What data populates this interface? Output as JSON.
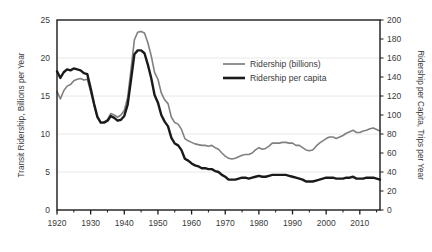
{
  "chart_data": {
    "type": "line",
    "title": "",
    "xlabel": "",
    "ylabel": "Transit Ridership, Billions per Year",
    "y2label": "Ridership per Capita, Trips per Year",
    "xlim": [
      1920,
      2016
    ],
    "ylim": [
      0,
      25
    ],
    "y2lim": [
      0,
      200
    ],
    "grid": true,
    "legend_position": "center-right-inside",
    "xticks": [
      1920,
      1930,
      1940,
      1950,
      1960,
      1970,
      1980,
      1990,
      2000,
      2010
    ],
    "xtick_labels": [
      "1920",
      "1930",
      "1940",
      "1950",
      "1960",
      "1970",
      "1980",
      "1990",
      "2000",
      "2010"
    ],
    "xminor_step": 5,
    "yticks": [
      0,
      5,
      10,
      15,
      20,
      25
    ],
    "ytick_labels": [
      "0",
      "5",
      "10",
      "15",
      "20",
      "25"
    ],
    "y2ticks": [
      0,
      20,
      40,
      60,
      80,
      100,
      120,
      140,
      160,
      180,
      200
    ],
    "y2tick_labels": [
      "0",
      "20",
      "40",
      "60",
      "80",
      "100",
      "120",
      "140",
      "160",
      "180",
      "200"
    ],
    "series": [
      {
        "name": "Ridership (billions)",
        "color": "#808080",
        "axis": "left",
        "width": 1.6,
        "x": [
          1920,
          1921,
          1922,
          1923,
          1924,
          1925,
          1926,
          1927,
          1928,
          1929,
          1930,
          1931,
          1932,
          1933,
          1934,
          1935,
          1936,
          1937,
          1938,
          1939,
          1940,
          1941,
          1942,
          1943,
          1944,
          1945,
          1946,
          1947,
          1948,
          1949,
          1950,
          1951,
          1952,
          1953,
          1954,
          1955,
          1956,
          1957,
          1958,
          1959,
          1960,
          1961,
          1962,
          1963,
          1964,
          1965,
          1966,
          1967,
          1968,
          1969,
          1970,
          1971,
          1972,
          1973,
          1974,
          1975,
          1976,
          1977,
          1978,
          1979,
          1980,
          1981,
          1982,
          1983,
          1984,
          1985,
          1986,
          1987,
          1988,
          1989,
          1990,
          1991,
          1992,
          1993,
          1994,
          1995,
          1996,
          1997,
          1998,
          1999,
          2000,
          2001,
          2002,
          2003,
          2004,
          2005,
          2006,
          2007,
          2008,
          2009,
          2010,
          2011,
          2012,
          2013,
          2014,
          2015,
          2016
        ],
        "values": [
          15.6,
          14.6,
          15.7,
          16.3,
          16.5,
          17.0,
          17.2,
          17.3,
          17.1,
          17.2,
          15.6,
          13.8,
          12.2,
          11.5,
          11.6,
          11.9,
          12.7,
          12.5,
          12.2,
          12.5,
          13.1,
          14.8,
          18.5,
          22.4,
          23.4,
          23.5,
          23.3,
          22.0,
          20.3,
          18.1,
          17.2,
          15.4,
          14.5,
          14.0,
          12.2,
          11.5,
          11.3,
          10.6,
          9.4,
          9.1,
          8.9,
          8.7,
          8.6,
          8.5,
          8.5,
          8.4,
          8.5,
          8.2,
          8.0,
          7.5,
          7.1,
          6.8,
          6.7,
          6.8,
          7.0,
          7.2,
          7.3,
          7.3,
          7.5,
          7.9,
          8.2,
          8.0,
          8.1,
          8.4,
          8.8,
          8.8,
          8.8,
          8.9,
          8.9,
          8.8,
          8.8,
          8.5,
          8.5,
          8.2,
          7.9,
          7.8,
          7.9,
          8.4,
          8.8,
          9.1,
          9.4,
          9.6,
          9.6,
          9.4,
          9.6,
          9.8,
          10.1,
          10.3,
          10.5,
          10.2,
          10.2,
          10.4,
          10.5,
          10.7,
          10.8,
          10.6,
          10.4
        ]
      },
      {
        "name": "Ridership per capita",
        "color": "#1a1a1a",
        "axis": "right",
        "width": 2.4,
        "x": [
          1920,
          1921,
          1922,
          1923,
          1924,
          1925,
          1926,
          1927,
          1928,
          1929,
          1930,
          1931,
          1932,
          1933,
          1934,
          1935,
          1936,
          1937,
          1938,
          1939,
          1940,
          1941,
          1942,
          1943,
          1944,
          1945,
          1946,
          1947,
          1948,
          1949,
          1950,
          1951,
          1952,
          1953,
          1954,
          1955,
          1956,
          1957,
          1958,
          1959,
          1960,
          1961,
          1962,
          1963,
          1964,
          1965,
          1966,
          1967,
          1968,
          1969,
          1970,
          1971,
          1972,
          1973,
          1974,
          1975,
          1976,
          1977,
          1978,
          1979,
          1980,
          1981,
          1982,
          1983,
          1984,
          1985,
          1986,
          1987,
          1988,
          1989,
          1990,
          1991,
          1992,
          1993,
          1994,
          1995,
          1996,
          1997,
          1998,
          1999,
          2000,
          2001,
          2002,
          2003,
          2004,
          2005,
          2006,
          2007,
          2008,
          2009,
          2010,
          2011,
          2012,
          2013,
          2014,
          2015,
          2016
        ],
        "values": [
          146,
          139,
          145,
          148,
          147,
          149,
          148,
          147,
          144,
          143,
          128,
          112,
          98,
          92,
          92,
          94,
          99,
          97,
          94,
          95,
          99,
          111,
          137,
          164,
          168,
          168,
          165,
          153,
          139,
          121,
          113,
          100,
          93,
          88,
          76,
          70,
          68,
          63,
          54,
          52,
          49,
          47,
          46,
          44,
          44,
          43,
          43,
          41,
          40,
          37,
          35,
          32,
          32,
          32,
          33,
          34,
          34,
          33,
          34,
          35,
          36,
          35,
          35,
          36,
          37,
          37,
          37,
          37,
          37,
          36,
          35,
          34,
          33,
          32,
          30,
          30,
          30,
          31,
          32,
          33,
          34,
          34,
          34,
          33,
          33,
          33,
          34,
          34,
          35,
          33,
          33,
          33,
          34,
          34,
          34,
          33,
          32
        ]
      }
    ]
  },
  "legend": {
    "entries": [
      {
        "label": "Ridership (billions)",
        "color": "#808080",
        "thickness": "thin"
      },
      {
        "label": "Ridership per capita",
        "color": "#1a1a1a",
        "thickness": "thick"
      }
    ]
  },
  "axes": {
    "left_title": "Transit Ridership, Billions per Year",
    "right_title": "Ridership per Capita, Trips per Year"
  },
  "colors": {
    "background": "#ffffff",
    "axis": "#1a1a1a",
    "grid": "#e8e8e8",
    "text": "#3a3a3a",
    "series_gray": "#808080",
    "series_black": "#1a1a1a"
  }
}
